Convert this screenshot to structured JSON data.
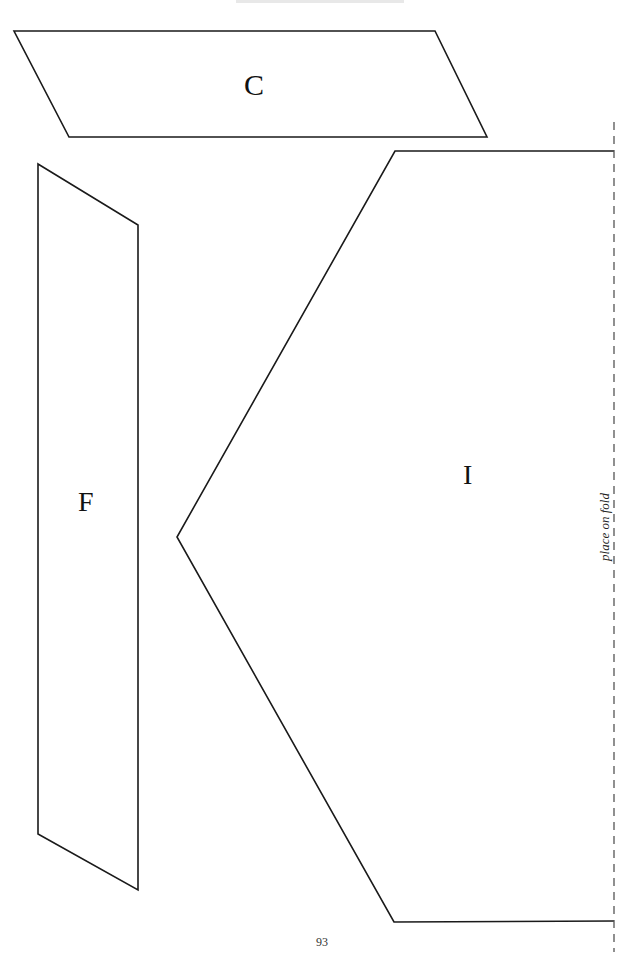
{
  "page": {
    "type": "sewing-pattern-page",
    "header_cutoff": "",
    "page_number": "93"
  },
  "pieces": [
    {
      "id": "C",
      "label": "C",
      "shape": "parallelogram",
      "points": [
        [
          14,
          31
        ],
        [
          435,
          31
        ],
        [
          487,
          137
        ],
        [
          69,
          137
        ]
      ]
    },
    {
      "id": "F",
      "label": "F",
      "shape": "quadrilateral",
      "points": [
        [
          38,
          164
        ],
        [
          138,
          225
        ],
        [
          138,
          890
        ],
        [
          38,
          834
        ]
      ]
    },
    {
      "id": "I",
      "label": "I",
      "shape": "pentagon-half",
      "points": [
        [
          395,
          151
        ],
        [
          614,
          151
        ],
        [
          614,
          921
        ],
        [
          394,
          922
        ],
        [
          177,
          537
        ]
      ]
    }
  ],
  "fold_line": {
    "label": "place on fold",
    "x": 614,
    "y_start": 122,
    "y_end": 952,
    "style": "dashed"
  },
  "colors": {
    "line": "#1a1a1a",
    "fold_line": "#555555",
    "background": "#ffffff"
  }
}
